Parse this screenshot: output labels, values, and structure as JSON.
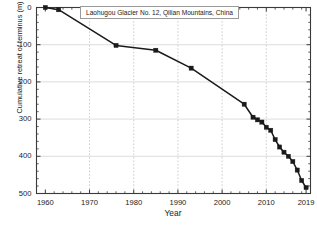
{
  "chart_data": {
    "type": "line",
    "title": "Laohugou Glacier No. 12, Qilian Mountains, China",
    "xlabel": "Year",
    "ylabel": "Cumulative retreat of terminus (m)",
    "xlim": [
      1958,
      2020
    ],
    "ylim": [
      0,
      500
    ],
    "y_inverted": true,
    "grid": "horizontal solid light-gray; vertical dashed at decades",
    "legend": null,
    "x_ticks": [
      1960,
      1970,
      1980,
      1990,
      2000,
      2010,
      2019
    ],
    "x_tick_labels": [
      "1960",
      "1970",
      "1980",
      "1990",
      "2000",
      "2010",
      "2019"
    ],
    "y_ticks": [
      0,
      100,
      200,
      300,
      400,
      500
    ],
    "y_tick_labels": [
      "0",
      "100",
      "200",
      "300",
      "400",
      "500"
    ],
    "marker": "filled-square",
    "line_color": "#1a1a1a",
    "marker_color": "#1a1a1a",
    "series": [
      {
        "name": "Cumulative terminus retreat",
        "x": [
          1960,
          1963,
          1976,
          1985,
          1993,
          2005,
          2007,
          2008,
          2009,
          2010,
          2011,
          2012,
          2013,
          2014,
          2015,
          2016,
          2017,
          2018,
          2019
        ],
        "values": [
          0,
          6,
          102,
          115,
          163,
          260,
          295,
          302,
          308,
          322,
          330,
          355,
          375,
          389,
          400,
          414,
          437,
          465,
          484
        ]
      }
    ]
  },
  "axes": {
    "frame_color": "#3a3a3a",
    "gridline_color": "#cfcfcf",
    "dashed_gridline_color": "#b9b9b9"
  }
}
